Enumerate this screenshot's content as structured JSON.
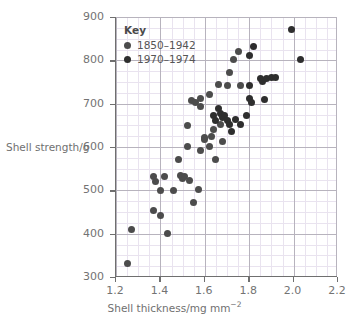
{
  "chart_data": {
    "type": "scatter",
    "title": "",
    "xlabel": "Shell thickness/mg mm",
    "xlabel_sup": "−2",
    "ylabel": "Shell strength/g",
    "xlim": [
      1.2,
      2.2
    ],
    "ylim": [
      300,
      900
    ],
    "xticks": [
      "1.2",
      "1.4",
      "1.6",
      "1.8",
      "2.0",
      "2.2"
    ],
    "xtick_values": [
      1.2,
      1.4,
      1.6,
      1.8,
      2.0,
      2.2
    ],
    "yticks": [
      "300",
      "400",
      "500",
      "600",
      "700",
      "800",
      "900"
    ],
    "ytick_values": [
      300,
      400,
      500,
      600,
      700,
      800,
      900
    ],
    "x_minor_step": 0.05,
    "y_minor_step": 25,
    "grid": true,
    "legend_position": "top-left",
    "legend_title": "Key",
    "series": [
      {
        "name": "1850–1942",
        "color": "#4c4c4c",
        "points": [
          [
            1.25,
            332
          ],
          [
            1.27,
            410
          ],
          [
            1.37,
            453
          ],
          [
            1.37,
            531
          ],
          [
            1.38,
            520
          ],
          [
            1.4,
            441
          ],
          [
            1.4,
            500
          ],
          [
            1.42,
            533
          ],
          [
            1.43,
            400
          ],
          [
            1.46,
            500
          ],
          [
            1.48,
            571
          ],
          [
            1.49,
            535
          ],
          [
            1.5,
            528
          ],
          [
            1.51,
            531
          ],
          [
            1.52,
            650
          ],
          [
            1.52,
            602
          ],
          [
            1.53,
            522
          ],
          [
            1.54,
            708
          ],
          [
            1.55,
            471
          ],
          [
            1.56,
            703
          ],
          [
            1.57,
            501
          ],
          [
            1.58,
            592
          ],
          [
            1.58,
            712
          ],
          [
            1.58,
            694
          ],
          [
            1.6,
            622
          ],
          [
            1.6,
            618
          ],
          [
            1.62,
            601
          ],
          [
            1.62,
            722
          ],
          [
            1.63,
            624
          ],
          [
            1.64,
            641
          ],
          [
            1.65,
            571
          ],
          [
            1.66,
            744
          ],
          [
            1.67,
            652
          ],
          [
            1.68,
            612
          ],
          [
            1.7,
            742
          ],
          [
            1.71,
            773
          ],
          [
            1.73,
            802
          ],
          [
            1.75,
            820
          ],
          [
            1.76,
            741
          ]
        ]
      },
      {
        "name": "1970–1974",
        "color": "#2e2e2e",
        "points": [
          [
            1.64,
            672
          ],
          [
            1.65,
            662
          ],
          [
            1.66,
            690
          ],
          [
            1.67,
            678
          ],
          [
            1.68,
            668
          ],
          [
            1.69,
            672
          ],
          [
            1.7,
            661
          ],
          [
            1.71,
            651
          ],
          [
            1.72,
            636
          ],
          [
            1.74,
            663
          ],
          [
            1.76,
            652
          ],
          [
            1.79,
            673
          ],
          [
            1.8,
            812
          ],
          [
            1.8,
            742
          ],
          [
            1.8,
            712
          ],
          [
            1.81,
            703
          ],
          [
            1.82,
            832
          ],
          [
            1.85,
            758
          ],
          [
            1.86,
            752
          ],
          [
            1.87,
            709
          ],
          [
            1.88,
            757
          ],
          [
            1.9,
            761
          ],
          [
            1.92,
            760
          ],
          [
            1.99,
            872
          ],
          [
            2.03,
            802
          ]
        ]
      }
    ]
  }
}
